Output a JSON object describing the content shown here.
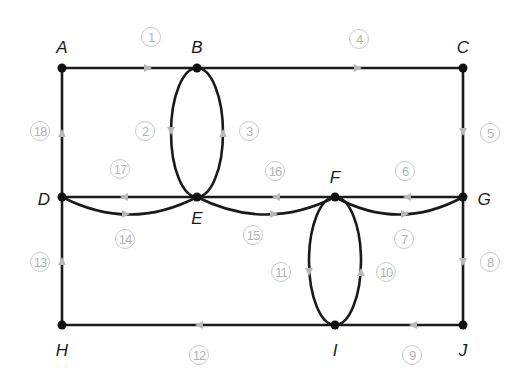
{
  "diagram": {
    "type": "directed multigraph (Euler circuit)",
    "colors": {
      "edge": "#1a1a1a",
      "node": "#111111",
      "arrow": "#b8b8b8",
      "edge_label": "#b4b4b4"
    },
    "nodes": [
      {
        "id": "A",
        "label": "A",
        "x": 62,
        "y": 68,
        "lx": 62,
        "ly": 47
      },
      {
        "id": "B",
        "label": "B",
        "x": 197,
        "y": 68,
        "lx": 197,
        "ly": 47
      },
      {
        "id": "C",
        "label": "C",
        "x": 463,
        "y": 68,
        "lx": 463,
        "ly": 47
      },
      {
        "id": "D",
        "label": "D",
        "x": 62,
        "y": 197,
        "lx": 44,
        "ly": 199
      },
      {
        "id": "E",
        "label": "E",
        "x": 197,
        "y": 197,
        "lx": 197,
        "ly": 218
      },
      {
        "id": "F",
        "label": "F",
        "x": 335,
        "y": 197,
        "lx": 335,
        "ly": 177
      },
      {
        "id": "G",
        "label": "G",
        "x": 463,
        "y": 197,
        "lx": 484,
        "ly": 199
      },
      {
        "id": "H",
        "label": "H",
        "x": 62,
        "y": 325,
        "lx": 62,
        "ly": 350
      },
      {
        "id": "I",
        "label": "I",
        "x": 335,
        "y": 325,
        "lx": 335,
        "ly": 350
      },
      {
        "id": "J",
        "label": "J",
        "x": 463,
        "y": 325,
        "lx": 463,
        "ly": 350
      }
    ],
    "edges": [
      {
        "n": "1",
        "from": "A",
        "to": "B",
        "lx": 151,
        "ly": 37
      },
      {
        "n": "2",
        "from": "B",
        "to": "E",
        "lx": 145,
        "ly": 131
      },
      {
        "n": "3",
        "from": "E",
        "to": "B",
        "lx": 249,
        "ly": 131
      },
      {
        "n": "4",
        "from": "B",
        "to": "C",
        "lx": 359,
        "ly": 39
      },
      {
        "n": "5",
        "from": "C",
        "to": "G",
        "lx": 490,
        "ly": 133
      },
      {
        "n": "6",
        "from": "G",
        "to": "F",
        "lx": 405,
        "ly": 171
      },
      {
        "n": "7",
        "from": "F",
        "to": "G",
        "lx": 404,
        "ly": 239
      },
      {
        "n": "8",
        "from": "G",
        "to": "J",
        "lx": 490,
        "ly": 262
      },
      {
        "n": "9",
        "from": "J",
        "to": "I",
        "lx": 412,
        "ly": 355
      },
      {
        "n": "10",
        "from": "I",
        "to": "F",
        "lx": 386,
        "ly": 272
      },
      {
        "n": "11",
        "from": "F",
        "to": "I",
        "lx": 281,
        "ly": 272
      },
      {
        "n": "12",
        "from": "I",
        "to": "H",
        "lx": 199,
        "ly": 355
      },
      {
        "n": "13",
        "from": "H",
        "to": "D",
        "lx": 40,
        "ly": 262
      },
      {
        "n": "14",
        "from": "D",
        "to": "E",
        "lx": 125,
        "ly": 239
      },
      {
        "n": "15",
        "from": "E",
        "to": "F",
        "lx": 253,
        "ly": 235
      },
      {
        "n": "16",
        "from": "F",
        "to": "E",
        "lx": 275,
        "ly": 171
      },
      {
        "n": "17",
        "from": "E",
        "to": "D",
        "lx": 120,
        "ly": 169
      },
      {
        "n": "18",
        "from": "D",
        "to": "A",
        "lx": 40,
        "ly": 131
      }
    ]
  }
}
